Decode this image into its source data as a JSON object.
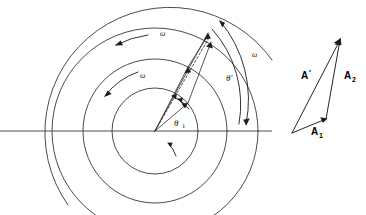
{
  "figure": {
    "background_color": "#ffffff",
    "ink_color": "#2b2b2b",
    "axis_color": "#4a4a4a"
  },
  "left_diagram": {
    "name": "concentric-phasor-diagram",
    "center": {
      "x": 155,
      "y": 131
    },
    "axis": {
      "x1": 0,
      "y1": 131,
      "x2": 272,
      "y2": 131
    },
    "circles": [
      {
        "name": "inner-circle",
        "radius": 43
      },
      {
        "name": "middle-circle",
        "radius": 72
      },
      {
        "name": "outer-circle",
        "radius": 103
      }
    ],
    "open_arc": {
      "name": "outermost-open-arc",
      "radius": 125
    },
    "vectors": [
      {
        "name": "vector-A1",
        "angle_deg": 78,
        "length": 72,
        "style": "solid"
      },
      {
        "name": "vector-A-resultant",
        "angle_deg": 63,
        "length": 104,
        "style": "solid"
      },
      {
        "name": "vector-A2-reference",
        "angle_deg": 55,
        "length": 104,
        "style": "dashed"
      },
      {
        "name": "vector-A2-short",
        "angle_deg": 52,
        "length": 44,
        "style": "solid"
      },
      {
        "name": "vector-parallelogram-side",
        "angle_deg": 40,
        "length": 104,
        "style": "solid"
      }
    ],
    "labels": {
      "omega_outer": "ω",
      "omega_middle": "ω",
      "omega_right": "ω",
      "theta_prime": "θ′",
      "theta_1_symbol": "θ",
      "theta_1_subscript": "1"
    }
  },
  "right_diagram": {
    "name": "vector-sum-triangle",
    "labels": {
      "a_prime": "A",
      "a_prime_mark": "′",
      "a_one": "A",
      "a_one_sub": "1",
      "a_two": "A",
      "a_two_sub": "2"
    },
    "vertices": {
      "origin": {
        "x": 292,
        "y": 133
      },
      "mid": {
        "x": 327,
        "y": 118
      },
      "apex": {
        "x": 341,
        "y": 38
      }
    }
  }
}
